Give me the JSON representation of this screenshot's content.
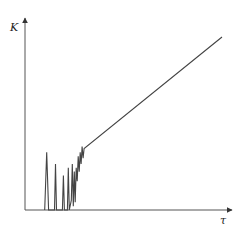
{
  "chart_data": {
    "type": "line",
    "title": "",
    "xlabel": "τ",
    "ylabel": "K",
    "grid": false,
    "legend": null,
    "series": [
      {
        "name": "K(τ)",
        "description": "Irregular oscillating spikes at small τ, transitioning into a linear increase",
        "points": [
          [
            0.1,
            0.0
          ],
          [
            0.11,
            0.3
          ],
          [
            0.12,
            0.0
          ],
          [
            0.15,
            0.0
          ],
          [
            0.155,
            0.24
          ],
          [
            0.16,
            0.0
          ],
          [
            0.19,
            0.0
          ],
          [
            0.195,
            0.18
          ],
          [
            0.2,
            0.0
          ],
          [
            0.215,
            0.0
          ],
          [
            0.22,
            0.22
          ],
          [
            0.225,
            0.0
          ],
          [
            0.235,
            0.05
          ],
          [
            0.24,
            0.24
          ],
          [
            0.245,
            0.02
          ],
          [
            0.25,
            0.2
          ],
          [
            0.255,
            0.04
          ],
          [
            0.26,
            0.22
          ],
          [
            0.265,
            0.15
          ],
          [
            0.27,
            0.28
          ],
          [
            0.275,
            0.2
          ],
          [
            0.28,
            0.3
          ],
          [
            0.285,
            0.24
          ],
          [
            0.29,
            0.33
          ],
          [
            0.295,
            0.27
          ],
          [
            0.3,
            0.32
          ],
          [
            1.0,
            0.9
          ]
        ]
      }
    ],
    "xlim": [
      0,
      1
    ],
    "ylim": [
      0,
      1
    ],
    "ticks": {
      "x": [],
      "y": []
    }
  },
  "axes": {
    "x_label": "τ",
    "y_label": "K"
  },
  "colors": {
    "axis": "#555555",
    "line": "#444444"
  }
}
